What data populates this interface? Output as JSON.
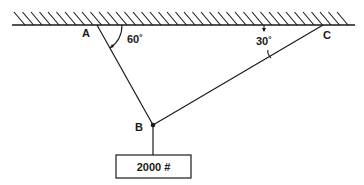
{
  "diagram": {
    "type": "statics-cable-support",
    "ceiling": {
      "hatched": true
    },
    "points": {
      "A": {
        "label": "A"
      },
      "B": {
        "label": "B"
      },
      "C": {
        "label": "C"
      }
    },
    "angles": {
      "at_A": "60˚",
      "at_C": "30˚"
    },
    "load": {
      "label": "2000 #"
    },
    "colors": {
      "line": "#1a1a1a",
      "background": "#ffffff"
    }
  }
}
